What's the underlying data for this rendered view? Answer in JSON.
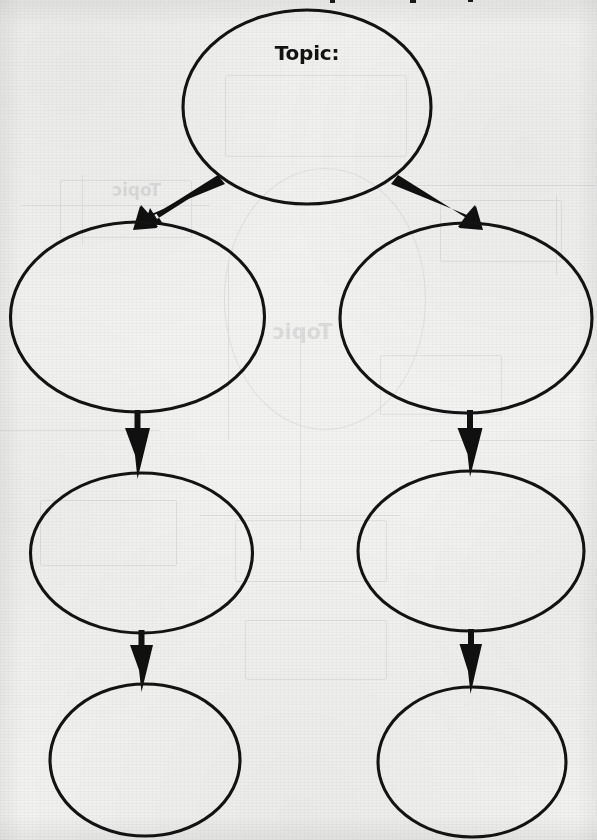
{
  "document": {
    "kind": "worksheet-graphic-organizer",
    "page_background_color": "#f2f2f1",
    "ink_color": "#121212",
    "title_cut_off": true
  },
  "organizer": {
    "name": "topic-sequence-chart",
    "root": {
      "id": "node-topic",
      "label": "Topic:",
      "writing_line": ""
    },
    "branches": [
      {
        "id": "branch-left",
        "nodes": [
          {
            "id": "node-left-1",
            "label": ""
          },
          {
            "id": "node-left-2",
            "label": ""
          },
          {
            "id": "node-left-3",
            "label": ""
          }
        ]
      },
      {
        "id": "branch-right",
        "nodes": [
          {
            "id": "node-right-1",
            "label": ""
          },
          {
            "id": "node-right-2",
            "label": ""
          },
          {
            "id": "node-right-3",
            "label": ""
          }
        ]
      }
    ],
    "connectors": [
      {
        "id": "arrow-topic-to-left-1",
        "from": "node-topic",
        "to": "node-left-1",
        "direction": "down-left"
      },
      {
        "id": "arrow-topic-to-right-1",
        "from": "node-topic",
        "to": "node-right-1",
        "direction": "down-right"
      },
      {
        "id": "arrow-left-1-to-left-2",
        "from": "node-left-1",
        "to": "node-left-2",
        "direction": "down"
      },
      {
        "id": "arrow-right-1-to-right-2",
        "from": "node-right-1",
        "to": "node-right-2",
        "direction": "down"
      },
      {
        "id": "arrow-left-2-to-left-3",
        "from": "node-left-2",
        "to": "node-left-3",
        "direction": "down"
      },
      {
        "id": "arrow-right-2-to-right-3",
        "from": "node-right-2",
        "to": "node-right-3",
        "direction": "down"
      }
    ]
  },
  "ghost_showthrough": {
    "visible": true,
    "mirrored": true,
    "text": "Topic"
  }
}
